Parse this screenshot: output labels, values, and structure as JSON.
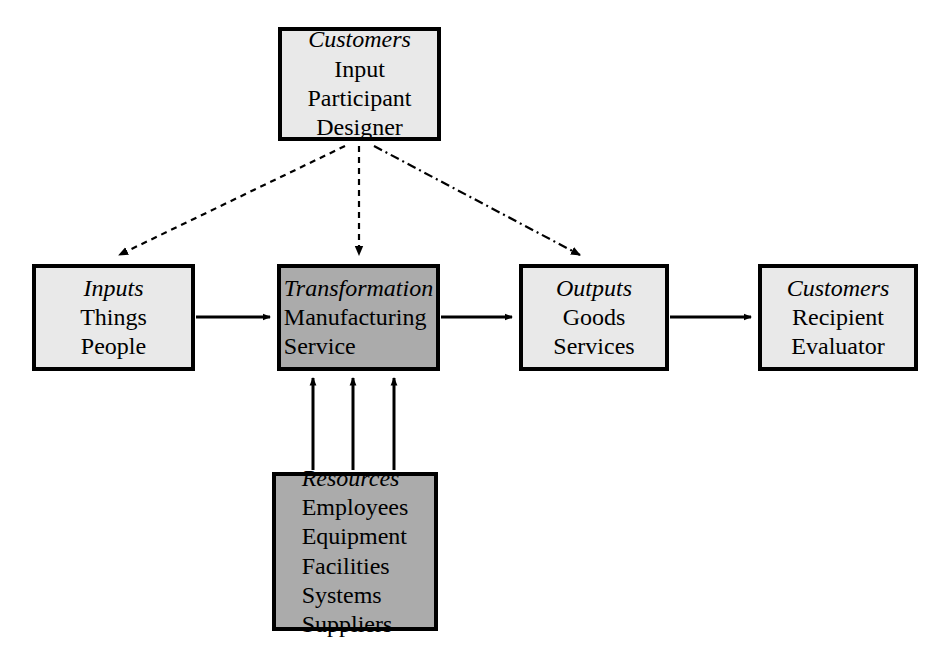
{
  "diagram": {
    "type": "process-flow",
    "background_color": "#ffffff",
    "border_color": "#000000",
    "fill_light": "#e9e9e9",
    "fill_dark": "#ababab",
    "nodes": [
      {
        "id": "customers-top",
        "title": "Customers",
        "lines": [
          "Input",
          "Participant",
          "Designer"
        ],
        "shade": "light",
        "align": "center"
      },
      {
        "id": "inputs",
        "title": "Inputs",
        "lines": [
          "Things",
          "People"
        ],
        "shade": "light",
        "align": "center"
      },
      {
        "id": "transformation",
        "title": "Transformation",
        "lines": [
          "Manufacturing",
          "Service"
        ],
        "shade": "dark",
        "align": "left"
      },
      {
        "id": "outputs",
        "title": "Outputs",
        "lines": [
          "Goods",
          "Services"
        ],
        "shade": "light",
        "align": "center"
      },
      {
        "id": "customers-end",
        "title": "Customers",
        "lines": [
          "Recipient",
          "Evaluator"
        ],
        "shade": "light",
        "align": "center"
      },
      {
        "id": "resources",
        "title": "Resources",
        "lines": [
          "Employees",
          "Equipment",
          "Facilities",
          "Systems",
          "Suppliers"
        ],
        "shade": "dark",
        "align": "left"
      }
    ],
    "connectors": [
      {
        "id": "inputs-to-transformation",
        "from": "inputs",
        "to": "transformation",
        "style": "solid",
        "direction": "right"
      },
      {
        "id": "transformation-to-outputs",
        "from": "transformation",
        "to": "outputs",
        "style": "solid",
        "direction": "right"
      },
      {
        "id": "outputs-to-customers",
        "from": "outputs",
        "to": "customers-end",
        "style": "solid",
        "direction": "right"
      },
      {
        "id": "customers-top-to-inputs",
        "from": "customers-top",
        "to": "inputs",
        "style": "dashed",
        "direction": "down-left"
      },
      {
        "id": "customers-top-to-transformation",
        "from": "customers-top",
        "to": "transformation",
        "style": "dashed",
        "direction": "down"
      },
      {
        "id": "customers-top-to-outputs",
        "from": "customers-top",
        "to": "outputs",
        "style": "dash-dot",
        "direction": "down-right"
      },
      {
        "id": "resources-to-transformation-left",
        "from": "resources",
        "to": "transformation",
        "style": "solid",
        "direction": "up"
      },
      {
        "id": "resources-to-transformation-center",
        "from": "resources",
        "to": "transformation",
        "style": "solid",
        "direction": "up"
      },
      {
        "id": "resources-to-transformation-right",
        "from": "resources",
        "to": "transformation",
        "style": "solid",
        "direction": "up"
      }
    ]
  }
}
